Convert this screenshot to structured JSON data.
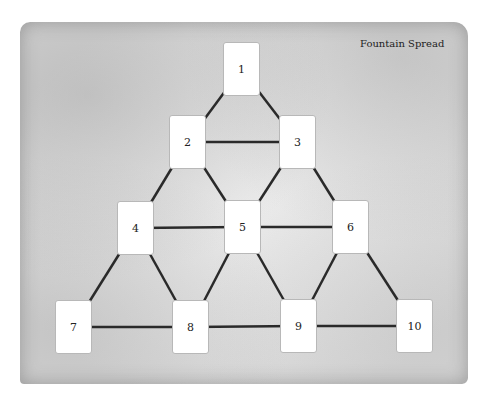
{
  "title": "Fountain Spread",
  "colors": {
    "line": "#2a2a2a",
    "card": "#ffffff",
    "parchment": "#e2e2e2"
  },
  "cards": [
    {
      "label": "1",
      "x": 223,
      "y": 42
    },
    {
      "label": "2",
      "x": 169,
      "y": 115
    },
    {
      "label": "3",
      "x": 279,
      "y": 115
    },
    {
      "label": "4",
      "x": 117,
      "y": 201
    },
    {
      "label": "5",
      "x": 224,
      "y": 200
    },
    {
      "label": "6",
      "x": 332,
      "y": 200
    },
    {
      "label": "7",
      "x": 55,
      "y": 300
    },
    {
      "label": "8",
      "x": 172,
      "y": 300
    },
    {
      "label": "9",
      "x": 280,
      "y": 299
    },
    {
      "label": "10",
      "x": 396,
      "y": 299
    }
  ],
  "edges": [
    [
      1,
      2
    ],
    [
      1,
      3
    ],
    [
      2,
      3
    ],
    [
      2,
      4
    ],
    [
      2,
      5
    ],
    [
      3,
      5
    ],
    [
      3,
      6
    ],
    [
      4,
      5
    ],
    [
      5,
      6
    ],
    [
      4,
      7
    ],
    [
      4,
      8
    ],
    [
      5,
      8
    ],
    [
      5,
      9
    ],
    [
      6,
      9
    ],
    [
      6,
      10
    ],
    [
      7,
      8
    ],
    [
      8,
      9
    ],
    [
      9,
      10
    ]
  ]
}
